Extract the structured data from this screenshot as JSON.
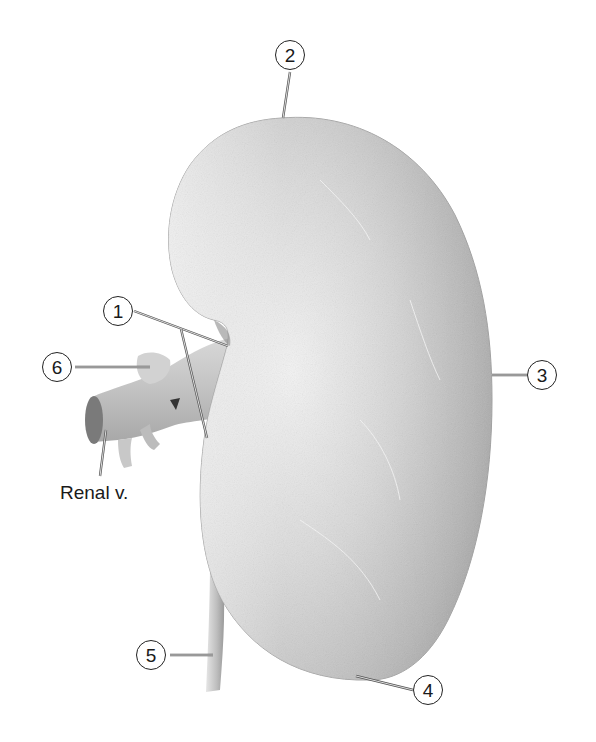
{
  "figure": {
    "background_color": "#ffffff",
    "colors": {
      "tissue_light": "#ededed",
      "tissue_mid": "#b8b8b8",
      "tissue_dark": "#8c8c8c",
      "leader_line": "#555555",
      "text": "#1a1a1a"
    }
  },
  "callouts": [
    {
      "number": "1",
      "x": 103,
      "y": 296
    },
    {
      "number": "2",
      "x": 275,
      "y": 40
    },
    {
      "number": "3",
      "x": 527,
      "y": 364
    },
    {
      "number": "4",
      "x": 413,
      "y": 677
    },
    {
      "number": "5",
      "x": 133,
      "y": 644
    },
    {
      "number": "6",
      "x": 40,
      "y": 350
    }
  ],
  "text_labels": [
    {
      "text": "Renal v.",
      "x": 62,
      "y": 494
    }
  ]
}
